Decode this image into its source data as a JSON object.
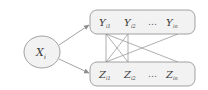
{
  "diagram": {
    "source_node": {
      "label": "X",
      "subscript": "i"
    },
    "top_group": {
      "nodes": [
        {
          "label": "Y",
          "subscript": "i1"
        },
        {
          "label": "Y",
          "subscript": "i2"
        },
        {
          "label": "…",
          "subscript": ""
        },
        {
          "label": "Y",
          "subscript": "in"
        }
      ]
    },
    "bottom_group": {
      "nodes": [
        {
          "label": "Z",
          "subscript": "i1"
        },
        {
          "label": "Z",
          "subscript": "i2"
        },
        {
          "label": "…",
          "subscript": ""
        },
        {
          "label": "Z",
          "subscript": "in"
        }
      ]
    },
    "edges": [
      {
        "from": "X_i",
        "to": "Y group",
        "type": "arrow"
      },
      {
        "from": "X_i",
        "to": "Z group",
        "type": "arrow"
      },
      {
        "from": "Y_i1",
        "to": "Z_i1",
        "type": "line"
      },
      {
        "from": "Y_i1",
        "to": "Z_i2",
        "type": "line"
      },
      {
        "from": "Y_i1",
        "to": "Z_in",
        "type": "line"
      },
      {
        "from": "Y_i2",
        "to": "Z_i1",
        "type": "line"
      },
      {
        "from": "Y_i2",
        "to": "Z_i2",
        "type": "line"
      },
      {
        "from": "Y_in",
        "to": "Z_i1",
        "type": "line"
      }
    ],
    "colors": {
      "node_fill": "#f2f2f2",
      "stroke": "#8c8c8c",
      "text": "#3a3a3a"
    }
  }
}
